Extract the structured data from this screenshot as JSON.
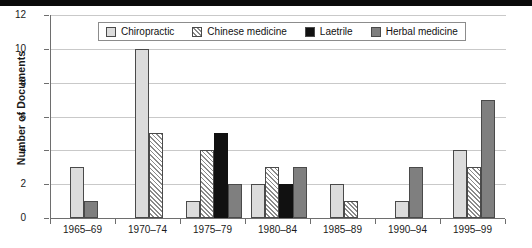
{
  "chart_data": {
    "type": "bar",
    "title": "",
    "xlabel": "",
    "ylabel": "Number of Documents",
    "ylim": [
      0,
      12
    ],
    "yticks": [
      0,
      2,
      4,
      6,
      8,
      10,
      12
    ],
    "grid": true,
    "legend_position": "top-center",
    "categories": [
      "1965–69",
      "1970–74",
      "1975–79",
      "1980–84",
      "1985–89",
      "1990–94",
      "1995–99"
    ],
    "series": [
      {
        "name": "Chiropractic",
        "color": "#dcdcdc",
        "pattern": "solid",
        "values": [
          3,
          10,
          1,
          2,
          2,
          1,
          4
        ]
      },
      {
        "name": "Chinese medicine",
        "color": "#ffffff",
        "pattern": "hatch",
        "values": [
          0,
          5,
          4,
          3,
          1,
          0,
          3
        ]
      },
      {
        "name": "Laetrile",
        "color": "#111111",
        "pattern": "solid",
        "values": [
          0,
          0,
          5,
          2,
          0,
          0,
          0
        ]
      },
      {
        "name": "Herbal medicine",
        "color": "#7f7f7f",
        "pattern": "solid",
        "values": [
          1,
          0,
          2,
          3,
          0,
          3,
          7
        ]
      }
    ]
  },
  "axes": {
    "y_title": "Number of Documents",
    "y_tick_labels": [
      "0",
      "2",
      "4",
      "6",
      "8",
      "10",
      "12"
    ],
    "x_tick_labels": [
      "1965–69",
      "1970–74",
      "1975–79",
      "1980–84",
      "1985–89",
      "1990–94",
      "1995–99"
    ]
  },
  "legend": {
    "items": [
      {
        "label": "Chiropractic"
      },
      {
        "label": "Chinese medicine"
      },
      {
        "label": "Laetrile"
      },
      {
        "label": "Herbal medicine"
      }
    ]
  }
}
